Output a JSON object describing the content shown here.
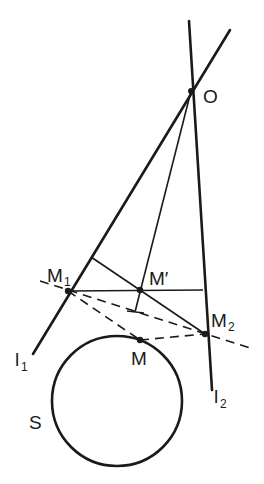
{
  "figure": {
    "labels": {
      "O": "O",
      "M1_main": "M",
      "M1_sub": "1",
      "M2_main": "M",
      "M2_sub": "2",
      "Mprime": "M′",
      "M": "M",
      "l1_main": "l",
      "l1_sub": "1",
      "l2_main": "l",
      "l2_sub": "2",
      "S": "S"
    },
    "points": {
      "O": [
        191,
        91
      ],
      "M1": [
        68,
        291
      ],
      "M2": [
        205,
        334
      ],
      "Mprime": [
        140,
        290
      ],
      "M": [
        140,
        340
      ]
    },
    "circle": {
      "name": "S",
      "cx": 117,
      "cy": 401,
      "r": 65
    },
    "lines": {
      "l1": {
        "from": [
          230,
          30
        ],
        "to": [
          33,
          354
        ],
        "style": "solid-thick"
      },
      "l2": {
        "from": [
          189,
          21
        ],
        "to": [
          212,
          390
        ],
        "style": "solid-thick"
      }
    }
  }
}
